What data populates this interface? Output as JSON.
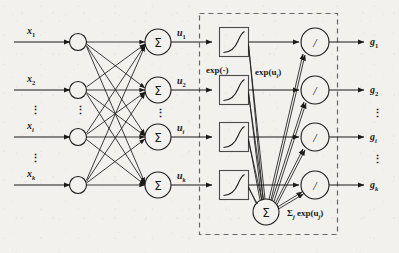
{
  "figure": {
    "background_color": "#f2f1ee",
    "ink_color": "#1a1a1a",
    "dashed_border_color": "#666666"
  },
  "inputs": {
    "labels": [
      "x",
      "x",
      "x",
      "x"
    ],
    "subscripts": [
      "1",
      "2",
      "i",
      "k"
    ],
    "ellipsis": "⋮"
  },
  "hidden": {
    "node_symbol": "Σ",
    "output_labels": [
      "u",
      "u",
      "u",
      "u"
    ],
    "output_subscripts": [
      "1",
      "2",
      "i",
      "k"
    ],
    "ellipsis": "⋮"
  },
  "exp_layer": {
    "box_label": "exp(·)",
    "edge_label_base": "exp(u",
    "edge_label_sub": "i",
    "edge_label_close": ")",
    "glyph": "exponential-curve"
  },
  "normalizer": {
    "node_symbol": "Σ",
    "label_base": "Σ",
    "label_sub1": "j",
    "label_mid": " exp(u",
    "label_sub2": "j",
    "label_close": ")"
  },
  "divide_layer": {
    "node_symbol": "/"
  },
  "outputs": {
    "labels": [
      "g",
      "g",
      "g",
      "g"
    ],
    "subscripts": [
      "1",
      "2",
      "i",
      "k"
    ],
    "ellipsis": "⋮"
  },
  "softmax_block": {
    "name": "softmax-dashed-region"
  }
}
